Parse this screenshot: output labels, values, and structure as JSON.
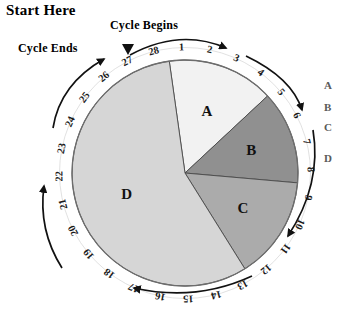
{
  "labels": {
    "start_here": "Start Here",
    "cycle_begins": "Cycle Begins",
    "cycle_ends": "Cycle Ends"
  },
  "legend": {
    "a": "A",
    "b": "B",
    "c": "C",
    "d": "D"
  },
  "chart_data": {
    "type": "pie",
    "title": "",
    "subtitle": "",
    "xlabel": "",
    "ylabel": "",
    "legend_position": "right",
    "grid": false,
    "annotations": [
      "Start Here",
      "Cycle Begins",
      "Cycle Ends"
    ],
    "ring_label": "Cycle day",
    "ring_ticks": [
      1,
      2,
      3,
      4,
      5,
      6,
      7,
      8,
      9,
      10,
      11,
      12,
      13,
      14,
      15,
      16,
      17,
      18,
      19,
      20,
      21,
      22,
      23,
      24,
      25,
      26,
      27,
      28
    ],
    "ring_total_days": 28,
    "ring_direction": "clockwise",
    "categories": [
      "A",
      "B",
      "C",
      "D"
    ],
    "values": [
      4.5,
      5.0,
      4.5,
      14.0
    ],
    "units": "days",
    "slice_start_days": [
      0.5,
      5.0,
      10.0,
      14.5
    ],
    "slice_end_days": [
      5.0,
      10.0,
      14.5,
      28.5
    ],
    "colors": [
      "#f2f2f2",
      "#909090",
      "#ababab",
      "#d6d6d6"
    ],
    "slices": [
      {
        "label": "A",
        "start_day": 0.5,
        "end_day": 5.0,
        "days": 4.5,
        "color": "#f2f2f2",
        "start_deg": -8,
        "end_deg": 47
      },
      {
        "label": "B",
        "start_day": 5.0,
        "end_day": 10.0,
        "days": 5.0,
        "color": "#909090",
        "start_deg": 47,
        "end_deg": 95
      },
      {
        "label": "C",
        "start_day": 10.0,
        "end_day": 14.5,
        "days": 4.5,
        "color": "#ababab",
        "start_deg": 95,
        "end_deg": 148
      },
      {
        "label": "D",
        "start_day": 14.5,
        "end_day": 28.5,
        "days": 14.0,
        "color": "#d6d6d6",
        "start_deg": 148,
        "end_deg": 352
      }
    ]
  }
}
